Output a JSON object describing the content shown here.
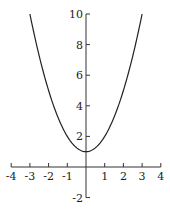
{
  "chart_data": {
    "type": "line",
    "title": "",
    "xlabel": "",
    "ylabel": "",
    "function": "y = x^2 + 1",
    "series": [
      {
        "name": "y = x^2 + 1",
        "x": [
          -3,
          -2.5,
          -2,
          -1.5,
          -1,
          -0.5,
          0,
          0.5,
          1,
          1.5,
          2,
          2.5,
          3
        ],
        "values": [
          10,
          7.25,
          5,
          3.25,
          2,
          1.25,
          1,
          1.25,
          2,
          3.25,
          5,
          7.25,
          10
        ]
      }
    ],
    "xlim": [
      -4,
      4
    ],
    "ylim": [
      -2,
      10
    ],
    "x_ticks": [
      -4,
      -3,
      -2,
      -1,
      1,
      2,
      3,
      4
    ],
    "x_tick_labels": [
      "-4",
      "-3",
      "-2",
      "-1",
      "1",
      "2",
      "3",
      "4"
    ],
    "y_ticks": [
      -2,
      2,
      4,
      6,
      8,
      10
    ],
    "y_tick_labels": [
      "-2",
      "2",
      "4",
      "6",
      "8",
      "10"
    ],
    "grid": false,
    "legend": null
  }
}
